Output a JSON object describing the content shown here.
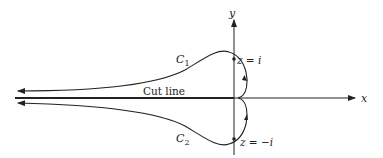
{
  "figure": {
    "axes": {
      "x_label": "x",
      "y_label": "y"
    },
    "cut_line_label": "Cut line",
    "contours": [
      {
        "name": "C",
        "subscript": "1",
        "point_label": "z = i"
      },
      {
        "name": "C",
        "subscript": "2",
        "point_label": "z = −i"
      }
    ],
    "colors": {
      "stroke": "#222222",
      "background": "#ffffff"
    }
  }
}
